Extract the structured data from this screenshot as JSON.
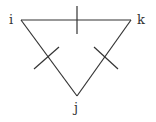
{
  "diagram": {
    "type": "triangle-graph",
    "vertices": [
      {
        "id": "i",
        "label": "i"
      },
      {
        "id": "k",
        "label": "k"
      },
      {
        "id": "j",
        "label": "j"
      }
    ],
    "edges": [
      {
        "from": "i",
        "to": "k",
        "marker": "tick"
      },
      {
        "from": "i",
        "to": "j",
        "marker": "tick"
      },
      {
        "from": "k",
        "to": "j",
        "marker": "tick"
      }
    ],
    "line_color": "#333333"
  }
}
